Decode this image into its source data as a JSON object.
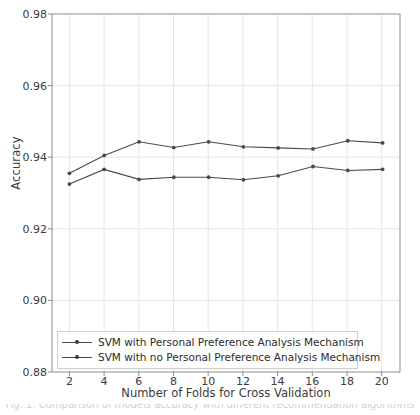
{
  "chart_data": {
    "type": "line",
    "title": "",
    "xlabel": "Number of Folds for Cross Validation",
    "ylabel": "Accuracy",
    "x": [
      2,
      4,
      6,
      8,
      10,
      12,
      14,
      16,
      18,
      20
    ],
    "xlim": [
      1,
      21
    ],
    "ylim": [
      0.88,
      0.98
    ],
    "xticks": [
      "2",
      "4",
      "6",
      "8",
      "10",
      "12",
      "14",
      "16",
      "18",
      "20"
    ],
    "yticks": [
      "0.88",
      "0.90",
      "0.92",
      "0.94",
      "0.96",
      "0.98"
    ],
    "ytick_values": [
      0.88,
      0.9,
      0.92,
      0.94,
      0.96,
      0.98
    ],
    "grid": true,
    "legend_position": "lower left",
    "series": [
      {
        "name": "SVM with Personal Preference Analysis Mechanism",
        "color": "#4a4a4a",
        "marker": "dot",
        "values": [
          0.9355,
          0.9405,
          0.9443,
          0.9427,
          0.9443,
          0.9429,
          0.9426,
          0.9423,
          0.9446,
          0.944
        ]
      },
      {
        "name": "SVM with no Personal Preference Analysis Mechanism",
        "color": "#4a4a4a",
        "marker": "dot",
        "values": [
          0.9325,
          0.9366,
          0.9338,
          0.9344,
          0.9344,
          0.9337,
          0.9348,
          0.9374,
          0.9363,
          0.9366
        ]
      }
    ]
  },
  "legend": {
    "items": [
      {
        "label": "SVM with Personal Preference Analysis Mechanism"
      },
      {
        "label": "SVM with no Personal Preference Analysis Mechanism"
      }
    ]
  },
  "caption": {
    "text": "Fig. 1. Comparison of models accuracy with different recommendation algorithms"
  },
  "colors": {
    "line": "#4a4a4a",
    "marker": "#3a3a3a",
    "grid": "#e3e3e3",
    "axis": "#9a9a9a",
    "text": "#3b3b3b"
  }
}
